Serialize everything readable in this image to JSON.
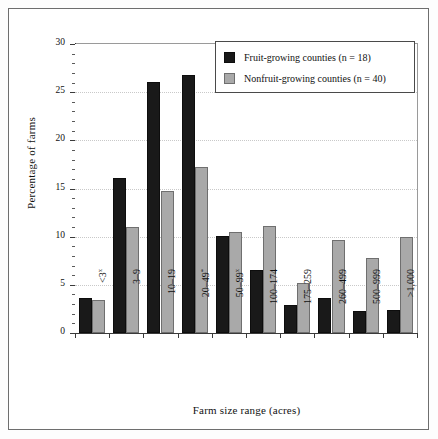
{
  "chart_data": {
    "type": "bar",
    "title": "",
    "xlabel": "Farm size range (acres)",
    "ylabel": "Percentage of farms",
    "ylim": [
      0,
      30
    ],
    "ytick_step": 5,
    "yminor_step": 1,
    "grid": "horizontal dotted",
    "legend_position": "top-right inside plot",
    "categories": [
      "<3",
      "3–9",
      "10–19",
      "20–49",
      "50–99",
      "100–174",
      "175–259",
      "260–499",
      "500–999",
      ">1,000"
    ],
    "category_markers": [
      "x",
      "",
      "",
      "*",
      "x",
      "",
      "",
      "",
      "",
      ""
    ],
    "ytick_labels": [
      "0",
      "5",
      "10",
      "15",
      "20",
      "25",
      "30"
    ],
    "series": [
      {
        "name": "Fruit-growing counties (n = 18)",
        "color": "#191919",
        "values": [
          3.6,
          16.1,
          26.1,
          26.8,
          10.1,
          6.5,
          2.9,
          3.6,
          2.3,
          2.4
        ]
      },
      {
        "name": "Nonfruit-growing counties (n = 40)",
        "color": "#a9a9a9",
        "values": [
          3.4,
          11.0,
          14.7,
          17.2,
          10.5,
          11.1,
          5.2,
          9.7,
          7.8,
          10.0
        ]
      }
    ]
  },
  "legend": {
    "entries": [
      {
        "label": "Fruit-growing counties (n = 18)",
        "swatch": "dark"
      },
      {
        "label": "Nonfruit-growing counties (n = 40)",
        "swatch": "light"
      }
    ]
  }
}
